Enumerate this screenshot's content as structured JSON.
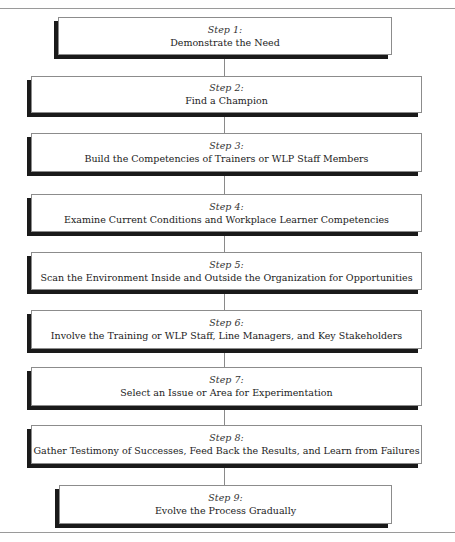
{
  "diagram": {
    "type": "vertical-flowchart",
    "steps": [
      {
        "label": "Step 1:",
        "title": "Demonstrate the Need"
      },
      {
        "label": "Step 2:",
        "title": "Find a Champion"
      },
      {
        "label": "Step 3:",
        "title": "Build the Competencies of Trainers or WLP Staff Members"
      },
      {
        "label": "Step 4:",
        "title": "Examine Current Conditions and Workplace Learner Competencies"
      },
      {
        "label": "Step 5:",
        "title": "Scan the Environment Inside and Outside the Organization for Opportunities"
      },
      {
        "label": "Step 6:",
        "title": "Involve the Training or WLP Staff, Line Managers, and Key Stakeholders"
      },
      {
        "label": "Step 7:",
        "title": "Select an Issue or Area for Experimentation"
      },
      {
        "label": "Step 8:",
        "title": "Gather Testimony of Successes, Feed Back the Results, and Learn from Failures"
      },
      {
        "label": "Step 9:",
        "title": "Evolve the Process Gradually"
      }
    ],
    "colors": {
      "box_border": "#8c8c8c",
      "shadow": "#1a1a1a",
      "connector": "#8a8a8a"
    }
  }
}
